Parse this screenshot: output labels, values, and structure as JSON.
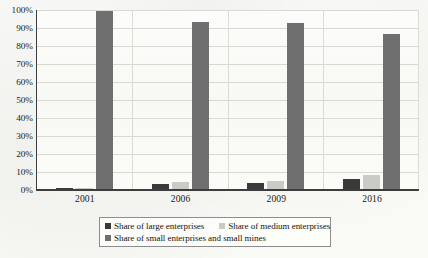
{
  "chart_data": {
    "type": "bar",
    "title": "",
    "subtitle": "",
    "xlabel": "",
    "ylabel": "",
    "categories": [
      "2001",
      "2006",
      "2009",
      "2016"
    ],
    "series": [
      {
        "name": "Share of large enterprises",
        "color": "#3a3a3a",
        "values": [
          0.3,
          2.8,
          3.5,
          5.3
        ]
      },
      {
        "name": "Share of medium enterprises",
        "color": "#cacac6",
        "values": [
          0.4,
          4.0,
          4.5,
          8.0
        ]
      },
      {
        "name": "Share of small enterprises and small mines",
        "color": "#6f6f6f",
        "values": [
          99.0,
          93.0,
          92.0,
          86.0
        ]
      }
    ],
    "ylim": [
      0,
      100
    ],
    "y_ticks": [
      "0%",
      "10%",
      "20%",
      "30%",
      "40%",
      "50%",
      "60%",
      "70%",
      "80%",
      "90%",
      "100%"
    ],
    "y_tick_values": [
      0,
      10,
      20,
      30,
      40,
      50,
      60,
      70,
      80,
      90,
      100
    ],
    "grid": true,
    "grid_axis": "y",
    "legend_position": "bottom",
    "value_suffix": "%"
  },
  "legend": {
    "items": [
      "Share of large enterprises",
      "Share of medium enterprises",
      "Share of small enterprises and small mines"
    ]
  },
  "colors": {
    "series_large": "#3a3a3a",
    "series_medium": "#cacac6",
    "series_small": "#6f6f6f",
    "axis": "#3d3d3d",
    "grid": "#d9d9d4",
    "background": "#fbfbf9"
  }
}
